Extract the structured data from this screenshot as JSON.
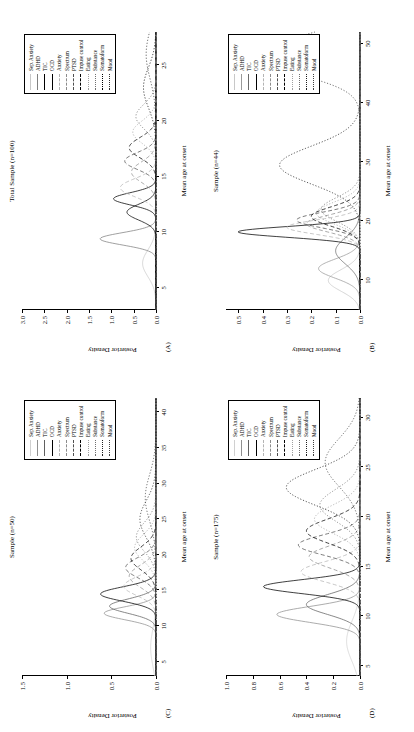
{
  "figure": {
    "panels": [
      {
        "tag": "(A)",
        "title": "Total Sample (n=100)",
        "xlabel": "Mean age at onset",
        "ylabel": "Posterior Density"
      },
      {
        "tag": "(B)",
        "title": "Sample (n=44)",
        "xlabel": "Mean age at onset",
        "ylabel": "Posterior Density"
      },
      {
        "tag": "(C)",
        "title": "Sample (n=50)",
        "xlabel": "Mean age at onset",
        "ylabel": "Posterior Density"
      },
      {
        "tag": "(D)",
        "title": "Sample (n=175)",
        "xlabel": "Mean age at onset",
        "ylabel": "Posterior Density"
      }
    ],
    "legend_labels": [
      "Sep. Anxiety",
      "ADHD",
      "TIC",
      "OCD",
      "Anxiety",
      "Spectrum",
      "PTSD",
      "Impuse control",
      "Eating",
      "Substance",
      "Somatoform",
      "Mood"
    ]
  },
  "chart_data": [
    {
      "type": "line",
      "panel": "(A)",
      "title": "Total Sample (n=100)",
      "xlabel": "Mean age at onset",
      "ylabel": "Posterior Density",
      "xlim": [
        3,
        28
      ],
      "ylim": [
        0,
        3.0
      ],
      "xticks": [
        5,
        10,
        15,
        20,
        25
      ],
      "yticks": [
        0.0,
        0.5,
        1.0,
        1.5,
        2.0,
        2.5,
        3.0
      ],
      "grid": false,
      "legend_position": "top-right",
      "series": [
        {
          "name": "Sep. Anxiety",
          "peak_x": 7.2,
          "peak_y": 0.3,
          "width": 1.2,
          "style": "solid",
          "color": "#c8c8c8"
        },
        {
          "name": "ADHD",
          "peak_x": 9.4,
          "peak_y": 1.25,
          "width": 0.55,
          "style": "solid",
          "color": "#808080"
        },
        {
          "name": "TIC",
          "peak_x": 11.8,
          "peak_y": 0.65,
          "width": 0.7,
          "style": "solid",
          "color": "#000000"
        },
        {
          "name": "OCD",
          "peak_x": 13.0,
          "peak_y": 0.95,
          "width": 0.55,
          "style": "solid",
          "color": "#000000"
        },
        {
          "name": "Anxiety",
          "peak_x": 14.0,
          "peak_y": 0.8,
          "width": 0.8,
          "style": "dashed",
          "color": "#b4b4b4"
        },
        {
          "name": "Spectrum",
          "peak_x": 15.4,
          "peak_y": 0.55,
          "width": 0.9,
          "style": "dashed",
          "color": "#8c8c8c"
        },
        {
          "name": "PTSD",
          "peak_x": 16.4,
          "peak_y": 0.7,
          "width": 0.75,
          "style": "dashed",
          "color": "#505050"
        },
        {
          "name": "Impuse control",
          "peak_x": 17.6,
          "peak_y": 0.6,
          "width": 0.9,
          "style": "dashed",
          "color": "#000000"
        },
        {
          "name": "Eating",
          "peak_x": 19.0,
          "peak_y": 0.52,
          "width": 1.0,
          "style": "dotted",
          "color": "#a0a0a0"
        },
        {
          "name": "Substance",
          "peak_x": 20.4,
          "peak_y": 0.45,
          "width": 1.1,
          "style": "dotted",
          "color": "#707070"
        },
        {
          "name": "Somatoform",
          "peak_x": 23.0,
          "peak_y": 0.28,
          "width": 1.8,
          "style": "dotted",
          "color": "#000000"
        },
        {
          "name": "Mood",
          "peak_x": 26.0,
          "peak_y": 0.22,
          "width": 2.2,
          "style": "dotted",
          "color": "#303030"
        }
      ]
    },
    {
      "type": "line",
      "panel": "(B)",
      "title": "Sample (n=44)",
      "xlabel": "Mean age at onset",
      "ylabel": "Posterior Density",
      "xlim": [
        5,
        52
      ],
      "ylim": [
        0,
        0.55
      ],
      "xticks": [
        10,
        20,
        30,
        40,
        50
      ],
      "yticks": [
        0.0,
        0.1,
        0.2,
        0.3,
        0.4,
        0.5
      ],
      "grid": false,
      "legend_position": "top-right",
      "series": [
        {
          "name": "Sep. Anxiety",
          "peak_x": 10.0,
          "peak_y": 0.13,
          "width": 1.8,
          "style": "solid",
          "color": "#c8c8c8"
        },
        {
          "name": "ADHD",
          "peak_x": 12.0,
          "peak_y": 0.17,
          "width": 1.6,
          "style": "solid",
          "color": "#9a9a9a"
        },
        {
          "name": "TIC",
          "peak_x": 15.0,
          "peak_y": 0.1,
          "width": 2.2,
          "style": "solid",
          "color": "#6a6a6a"
        },
        {
          "name": "OCD",
          "peak_x": 18.2,
          "peak_y": 0.5,
          "width": 0.9,
          "style": "solid",
          "color": "#000000"
        },
        {
          "name": "Anxiety",
          "peak_x": 19.0,
          "peak_y": 0.3,
          "width": 1.2,
          "style": "dashed",
          "color": "#b4b4b4"
        },
        {
          "name": "Spectrum",
          "peak_x": 19.6,
          "peak_y": 0.22,
          "width": 1.4,
          "style": "dashed",
          "color": "#8c8c8c"
        },
        {
          "name": "PTSD",
          "peak_x": 20.2,
          "peak_y": 0.26,
          "width": 1.3,
          "style": "dashed",
          "color": "#505050"
        },
        {
          "name": "Impuse control",
          "peak_x": 20.8,
          "peak_y": 0.2,
          "width": 1.6,
          "style": "dashed",
          "color": "#000000"
        },
        {
          "name": "Eating",
          "peak_x": 21.4,
          "peak_y": 0.18,
          "width": 1.8,
          "style": "dotted",
          "color": "#a0a0a0"
        },
        {
          "name": "Substance",
          "peak_x": 22.0,
          "peak_y": 0.16,
          "width": 2.0,
          "style": "dotted",
          "color": "#707070"
        },
        {
          "name": "Somatoform",
          "peak_x": 29.5,
          "peak_y": 0.33,
          "width": 3.2,
          "style": "dotted",
          "color": "#202020"
        },
        {
          "name": "Mood",
          "peak_x": 48.0,
          "peak_y": 0.45,
          "width": 3.0,
          "style": "dotted",
          "color": "#404040"
        }
      ]
    },
    {
      "type": "line",
      "panel": "(C)",
      "title": "Sample (n=50)",
      "xlabel": "Mean age at onset",
      "ylabel": "Posterior Density",
      "xlim": [
        3,
        42
      ],
      "ylim": [
        0,
        1.5
      ],
      "xticks": [
        5,
        10,
        15,
        20,
        25,
        30,
        35,
        40
      ],
      "yticks": [
        0.0,
        0.5,
        1.0,
        1.5
      ],
      "grid": false,
      "legend_position": "top-right",
      "series": [
        {
          "name": "Sep. Anxiety",
          "peak_x": 7.0,
          "peak_y": 0.06,
          "width": 2.5,
          "style": "solid",
          "color": "#d0d0d0"
        },
        {
          "name": "ADHD",
          "peak_x": 11.8,
          "peak_y": 0.58,
          "width": 0.9,
          "style": "solid",
          "color": "#909090"
        },
        {
          "name": "TIC",
          "peak_x": 12.8,
          "peak_y": 0.52,
          "width": 1.0,
          "style": "solid",
          "color": "#606060"
        },
        {
          "name": "OCD",
          "peak_x": 14.5,
          "peak_y": 0.62,
          "width": 1.0,
          "style": "solid",
          "color": "#000000"
        },
        {
          "name": "Anxiety",
          "peak_x": 15.6,
          "peak_y": 0.36,
          "width": 1.3,
          "style": "dashed",
          "color": "#b4b4b4"
        },
        {
          "name": "Spectrum",
          "peak_x": 17.0,
          "peak_y": 0.3,
          "width": 1.5,
          "style": "dashed",
          "color": "#8c8c8c"
        },
        {
          "name": "PTSD",
          "peak_x": 18.2,
          "peak_y": 0.34,
          "width": 1.4,
          "style": "dashed",
          "color": "#505050"
        },
        {
          "name": "Impuse control",
          "peak_x": 19.5,
          "peak_y": 0.28,
          "width": 1.6,
          "style": "dashed",
          "color": "#000000"
        },
        {
          "name": "Eating",
          "peak_x": 21.0,
          "peak_y": 0.24,
          "width": 1.8,
          "style": "dotted",
          "color": "#a0a0a0"
        },
        {
          "name": "Substance",
          "peak_x": 22.5,
          "peak_y": 0.22,
          "width": 2.0,
          "style": "dotted",
          "color": "#707070"
        },
        {
          "name": "Somatoform",
          "peak_x": 25.0,
          "peak_y": 0.18,
          "width": 2.6,
          "style": "dotted",
          "color": "#202020"
        },
        {
          "name": "Mood",
          "peak_x": 28.0,
          "peak_y": 0.12,
          "width": 3.2,
          "style": "dotted",
          "color": "#404040"
        }
      ]
    },
    {
      "type": "line",
      "panel": "(D)",
      "title": "Sample (n=175)",
      "xlabel": "Mean age at onset",
      "ylabel": "Posterior Density",
      "xlim": [
        4,
        32
      ],
      "ylim": [
        0,
        1.0
      ],
      "xticks": [
        5,
        10,
        15,
        20,
        25,
        30
      ],
      "yticks": [
        0.0,
        0.2,
        0.4,
        0.6,
        0.8,
        1.0
      ],
      "grid": false,
      "legend_position": "top-right",
      "series": [
        {
          "name": "Sep. Anxiety",
          "peak_x": 7.5,
          "peak_y": 0.1,
          "width": 2.0,
          "style": "solid",
          "color": "#d0d0d0"
        },
        {
          "name": "ADHD",
          "peak_x": 10.2,
          "peak_y": 0.62,
          "width": 0.8,
          "style": "solid",
          "color": "#909090"
        },
        {
          "name": "TIC",
          "peak_x": 11.2,
          "peak_y": 0.4,
          "width": 1.0,
          "style": "solid",
          "color": "#606060"
        },
        {
          "name": "OCD",
          "peak_x": 13.0,
          "peak_y": 0.72,
          "width": 0.7,
          "style": "solid",
          "color": "#000000"
        },
        {
          "name": "Anxiety",
          "peak_x": 14.5,
          "peak_y": 0.44,
          "width": 1.0,
          "style": "dashed",
          "color": "#b4b4b4"
        },
        {
          "name": "Spectrum",
          "peak_x": 16.0,
          "peak_y": 0.38,
          "width": 1.1,
          "style": "dashed",
          "color": "#8c8c8c"
        },
        {
          "name": "PTSD",
          "peak_x": 17.2,
          "peak_y": 0.46,
          "width": 1.0,
          "style": "dashed",
          "color": "#505050"
        },
        {
          "name": "Impuse control",
          "peak_x": 18.6,
          "peak_y": 0.4,
          "width": 1.2,
          "style": "dashed",
          "color": "#000000"
        },
        {
          "name": "Eating",
          "peak_x": 19.8,
          "peak_y": 0.34,
          "width": 1.4,
          "style": "dotted",
          "color": "#a0a0a0"
        },
        {
          "name": "Substance",
          "peak_x": 21.2,
          "peak_y": 0.3,
          "width": 1.6,
          "style": "dotted",
          "color": "#707070"
        },
        {
          "name": "Somatoform",
          "peak_x": 23.0,
          "peak_y": 0.55,
          "width": 1.8,
          "style": "dotted",
          "color": "#202020"
        },
        {
          "name": "Mood",
          "peak_x": 25.5,
          "peak_y": 0.26,
          "width": 2.4,
          "style": "dotted",
          "color": "#404040"
        }
      ]
    }
  ]
}
